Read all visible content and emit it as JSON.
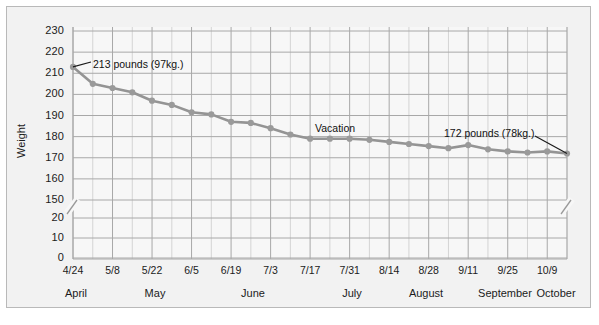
{
  "chart_data": {
    "type": "line",
    "title": "",
    "xlabel": "",
    "ylabel": "Weight",
    "ylim": [
      150,
      230
    ],
    "y_axis_broken": true,
    "y_break_lower_segment": [
      0,
      20
    ],
    "y_break_upper_segment": [
      150,
      230
    ],
    "ytick_labels": [
      "230",
      "220",
      "210",
      "200",
      "190",
      "180",
      "170",
      "160",
      "150",
      "20",
      "10",
      "0"
    ],
    "yticks_upper": [
      230,
      220,
      210,
      200,
      190,
      180,
      170,
      160,
      150
    ],
    "yticks_lower": [
      20,
      10,
      0
    ],
    "grid": true,
    "legend": false,
    "categories": [
      "4/24",
      "5/1",
      "5/8",
      "5/15",
      "5/22",
      "5/29",
      "6/5",
      "6/12",
      "6/19",
      "6/26",
      "7/3",
      "7/10",
      "7/17",
      "7/24",
      "7/31",
      "8/7",
      "8/14",
      "8/21",
      "8/28",
      "9/4",
      "9/11",
      "9/18",
      "9/25",
      "10/2",
      "10/9",
      "10/16"
    ],
    "xtick_labels": [
      "4/24",
      "5/8",
      "5/22",
      "6/5",
      "6/19",
      "7/3",
      "7/17",
      "7/31",
      "8/14",
      "8/28",
      "9/11",
      "9/25",
      "10/9"
    ],
    "month_labels": [
      "April",
      "May",
      "June",
      "July",
      "August",
      "September",
      "October"
    ],
    "values": [
      213,
      205,
      203,
      201,
      197,
      195,
      191.5,
      190.5,
      187,
      186.5,
      184,
      181,
      179,
      179,
      179,
      178.5,
      177.5,
      176.5,
      175.5,
      174.5,
      176,
      174,
      173,
      172.5,
      173,
      172
    ],
    "series": [
      {
        "name": "Weight",
        "values": [
          213,
          205,
          203,
          201,
          197,
          195,
          191.5,
          190.5,
          187,
          186.5,
          184,
          181,
          179,
          179,
          179,
          178.5,
          177.5,
          176.5,
          175.5,
          174.5,
          176,
          174,
          173,
          172.5,
          173,
          172
        ]
      }
    ],
    "annotations": [
      {
        "name": "start-weight",
        "text": "213 pounds (97kg.)",
        "point_index": 0,
        "value": 213
      },
      {
        "name": "vacation",
        "text": "Vacation",
        "point_index": 13,
        "value": 179
      },
      {
        "name": "end-weight",
        "text": "172 pounds (78kg.)",
        "point_index": 25,
        "value": 172
      }
    ],
    "colors": {
      "line": "#949494",
      "marker": "#9a9a9a",
      "grid_major": "#a8a8a8",
      "grid_minor": "#d2d2d2",
      "plot_background": "#f7f7f7",
      "frame_background": "#f2f2f2",
      "frame_border": "#b9b9b9",
      "text": "#1b1b1b"
    }
  }
}
